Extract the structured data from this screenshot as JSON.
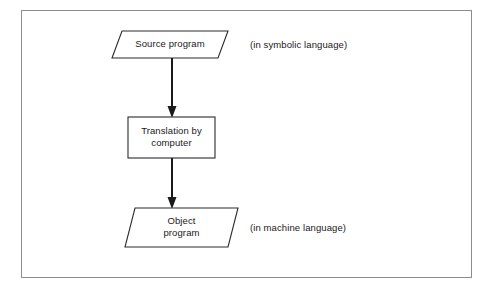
{
  "figure": {
    "name": "program-translation-flowchart",
    "background_color": "#ffffff",
    "frame_color": "#8d8d8d",
    "ink_color": "#1a1a1a"
  },
  "nodes": [
    {
      "id": "source-program",
      "shape": "parallelogram",
      "label": "Source program",
      "annotation": "(in symbolic language)"
    },
    {
      "id": "translation-by-computer",
      "shape": "rectangle",
      "label": "Translation by\ncomputer",
      "annotation": ""
    },
    {
      "id": "object-program",
      "shape": "parallelogram",
      "label": "Object\nprogram",
      "annotation": "(in machine language)"
    }
  ],
  "annotations": {
    "symbolic": "(in symbolic language)",
    "machine": "(in machine language)"
  },
  "connectors": [
    {
      "id": "arrow-source-to-translation",
      "from": "source-program",
      "to": "translation-by-computer",
      "direction": "down"
    },
    {
      "id": "arrow-translation-to-object",
      "from": "translation-by-computer",
      "to": "object-program",
      "direction": "down"
    }
  ]
}
